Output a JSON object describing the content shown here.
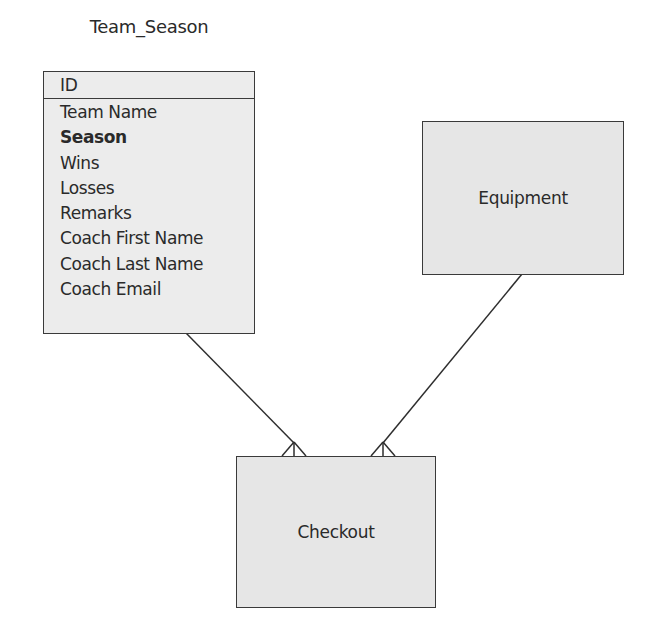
{
  "diagram": {
    "type": "entity-relationship",
    "entities": [
      {
        "name": "Team_Season",
        "primary_key": "ID",
        "attributes": [
          {
            "label": "Team Name",
            "bold": false
          },
          {
            "label": "Season",
            "bold": true
          },
          {
            "label": "Wins",
            "bold": false
          },
          {
            "label": "Losses",
            "bold": false
          },
          {
            "label": "Remarks",
            "bold": false
          },
          {
            "label": "Coach First Name",
            "bold": false
          },
          {
            "label": "Coach Last Name",
            "bold": false
          },
          {
            "label": "Coach Email",
            "bold": false
          }
        ]
      },
      {
        "name": "Equipment"
      },
      {
        "name": "Checkout"
      }
    ],
    "relationships": [
      {
        "from": "Team_Season",
        "to": "Checkout",
        "from_cardinality": "one",
        "to_cardinality": "many"
      },
      {
        "from": "Equipment",
        "to": "Checkout",
        "from_cardinality": "one",
        "to_cardinality": "many"
      }
    ]
  },
  "colors": {
    "entity_fill": "#e6e6e6",
    "border": "#3a3a3a",
    "text": "#2a2a2a"
  }
}
